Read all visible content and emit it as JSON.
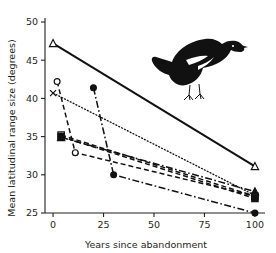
{
  "chart_data": {
    "type": "line",
    "title": "",
    "xlabel": "Years since abandonment",
    "ylabel": "Mean latitudinal range size (degrees)",
    "xlim": [
      -4,
      104
    ],
    "ylim": [
      25,
      50
    ],
    "xticks": [
      0,
      25,
      50,
      75,
      100
    ],
    "yticks": [
      25,
      30,
      35,
      40,
      45,
      50
    ],
    "xticklabels": [
      "0",
      "25",
      "50",
      "75",
      "100"
    ],
    "yticklabels": [
      "25",
      "30",
      "35",
      "40",
      "45",
      "50"
    ],
    "grid": false,
    "legend": false,
    "annotation_icon": "bird-silhouette",
    "series": [
      {
        "name": "series-open-triangle-solid",
        "marker": "open-triangle",
        "linestyle": "solid",
        "x": [
          0,
          100
        ],
        "y": [
          47.2,
          31.1
        ]
      },
      {
        "name": "series-open-circle-dashed",
        "marker": "open-circle",
        "linestyle": "dashed",
        "x": [
          2,
          11,
          100
        ],
        "y": [
          42.2,
          32.9,
          27.2
        ]
      },
      {
        "name": "series-cross-dotted",
        "marker": "cross",
        "linestyle": "dotted",
        "x": [
          0,
          100
        ],
        "y": [
          40.7,
          27.3
        ]
      },
      {
        "name": "series-filled-circle-dashdot",
        "marker": "filled-circle",
        "linestyle": "dashdot",
        "x": [
          20,
          30,
          100
        ],
        "y": [
          41.4,
          30.0,
          25.0
        ]
      },
      {
        "name": "series-open-square-dashed",
        "marker": "open-square",
        "linestyle": "dashed",
        "x": [
          4,
          100
        ],
        "y": [
          35.2,
          27.2
        ]
      },
      {
        "name": "series-filled-triangle-dashdot",
        "marker": "filled-triangle",
        "linestyle": "dashdot",
        "x": [
          4,
          100
        ],
        "y": [
          34.9,
          27.8
        ]
      },
      {
        "name": "series-filled-square-dashed",
        "marker": "filled-square",
        "linestyle": "dashed",
        "x": [
          4,
          100
        ],
        "y": [
          35.0,
          26.9
        ]
      }
    ]
  }
}
